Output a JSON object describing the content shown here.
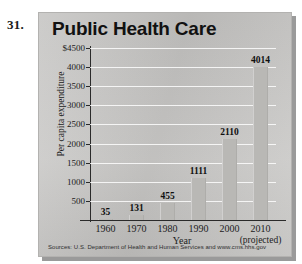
{
  "problem_number": "31.",
  "chart_data": {
    "type": "bar",
    "title": "Public Health Care",
    "xlabel": "Year",
    "ylabel": "Per capita expenditure",
    "categories": [
      "1960",
      "1970",
      "1980",
      "1990",
      "2000",
      "2010"
    ],
    "values": [
      35,
      131,
      455,
      1111,
      2110,
      4014
    ],
    "value_labels": [
      "35",
      "131",
      "455",
      "1111",
      "2110",
      "4014"
    ],
    "ylim": [
      0,
      4500
    ],
    "ytick_labels": [
      "$4500",
      "4000",
      "3500",
      "3000",
      "2500",
      "2000",
      "1500",
      "1000",
      "500"
    ],
    "ytick_values": [
      4500,
      4000,
      3500,
      3000,
      2500,
      2000,
      1500,
      1000,
      500
    ],
    "grid": true,
    "legend": "none",
    "annotations": [
      "(projected)"
    ],
    "projected_category": "2010",
    "source": "Sources: U.S. Department of Health and Human Services and www.cms.hhs.gov",
    "bar_color": "#b9b8b5",
    "panel_color": "#c9c8c6"
  }
}
